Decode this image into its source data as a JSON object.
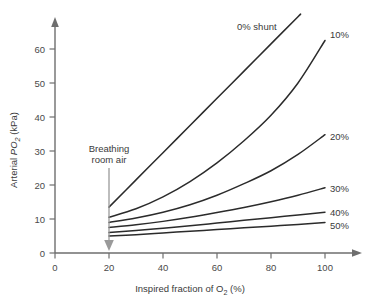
{
  "chart_data": {
    "type": "line",
    "title": "",
    "xlabel": "Inspired fraction of O2 (%)",
    "ylabel": "Arterial PO2 (kPa)",
    "xlim": [
      0,
      110
    ],
    "ylim": [
      0,
      70
    ],
    "xticks": [
      0,
      20,
      40,
      60,
      80,
      100
    ],
    "yticks": [
      0,
      10,
      20,
      30,
      40,
      50,
      60
    ],
    "grid": false,
    "legend_position": "inline-right-of-curves",
    "x": [
      20,
      30,
      40,
      50,
      60,
      70,
      80,
      90,
      100
    ],
    "series": [
      {
        "name": "0% shunt",
        "label": "0% shunt",
        "values": [
          13.5,
          21.5,
          29.5,
          37.5,
          45.5,
          53.5,
          61.5,
          69.5,
          77.0
        ]
      },
      {
        "name": "10%",
        "label": "10%",
        "values": [
          10.5,
          13.0,
          16.5,
          21.0,
          26.5,
          33.0,
          40.5,
          50.0,
          62.5
        ]
      },
      {
        "name": "20%",
        "label": "20%",
        "values": [
          9.0,
          10.3,
          12.0,
          14.2,
          17.0,
          20.4,
          24.2,
          29.0,
          34.8
        ]
      },
      {
        "name": "30%",
        "label": "30%",
        "values": [
          7.5,
          8.3,
          9.3,
          10.5,
          11.9,
          13.4,
          15.1,
          17.0,
          19.2
        ]
      },
      {
        "name": "40%",
        "label": "40%",
        "values": [
          6.0,
          6.6,
          7.3,
          8.0,
          8.8,
          9.6,
          10.4,
          11.2,
          12.0
        ]
      },
      {
        "name": "50%",
        "label": "50%",
        "values": [
          5.0,
          5.4,
          5.9,
          6.4,
          6.9,
          7.4,
          7.9,
          8.4,
          9.0
        ]
      }
    ],
    "annotations": [
      {
        "name": "breathing-room-air",
        "text_line1": "Breathing",
        "text_line2": "room air",
        "points_to_x": 20,
        "points_to_y": 0
      }
    ],
    "colors": {
      "curve": "#2b2b2b",
      "axis": "#6e6e6e",
      "annotation": "#9a9a9a",
      "text": "#3a3a3a",
      "background": "#ffffff"
    }
  },
  "axes": {
    "y_title_prefix": "Arterial ",
    "y_title_italic": "PO",
    "y_title_sub": "2",
    "y_title_suffix": " (kPa)",
    "x_title_prefix": "Inspired fraction of O",
    "x_title_sub": "2",
    "x_title_suffix": " (%)",
    "ytick_labels": [
      "0",
      "10",
      "20",
      "30",
      "40",
      "50",
      "60"
    ],
    "xtick_labels": [
      "0",
      "20",
      "40",
      "60",
      "80",
      "100"
    ]
  },
  "curve_labels": {
    "shunt0": "0% shunt",
    "shunt10": "10%",
    "shunt20": "20%",
    "shunt30": "30%",
    "shunt40": "40%",
    "shunt50": "50%"
  },
  "annotation": {
    "line1": "Breathing",
    "line2": "room air"
  }
}
